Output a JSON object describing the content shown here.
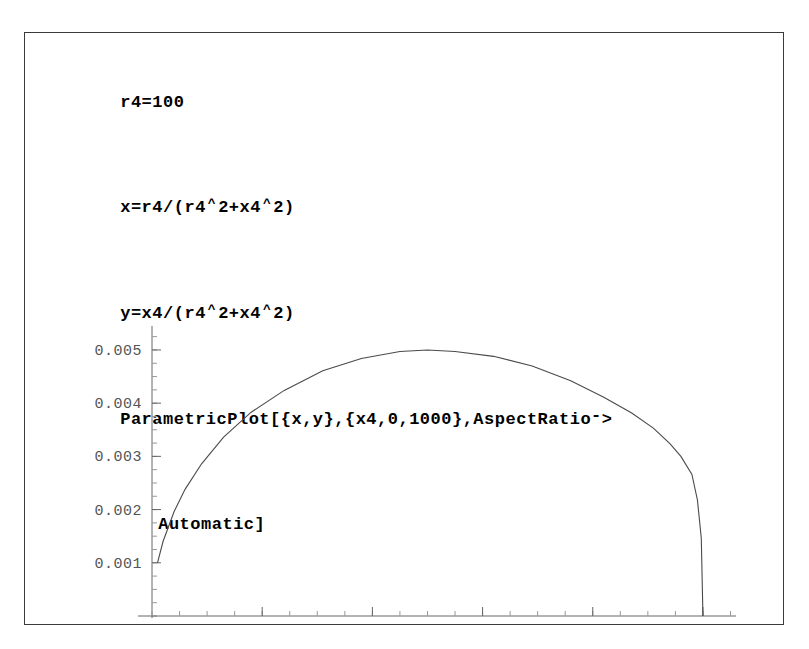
{
  "document": {
    "background_color": "#ffffff",
    "frame_border_color": "#3a3a3a"
  },
  "input_cell": {
    "lines": [
      {
        "id": "line-1",
        "text": "r4=100"
      },
      {
        "id": "line-2",
        "prefix": "x=r4/(r4",
        "caret1": "^",
        "mid": "2+x4",
        "caret2": "^",
        "suffix": "2)"
      },
      {
        "id": "line-3",
        "prefix": "y=x4/(r4",
        "caret1": "^",
        "mid": "2+x4",
        "caret2": "^",
        "suffix": "2)"
      },
      {
        "id": "line-4",
        "prefix": "ParametricPlot[{x,y},{x4,0,1000},AspectRatio",
        "arrow_dash": "-",
        "suffix": ">"
      },
      {
        "id": "line-5",
        "text": "Automatic]"
      }
    ],
    "r4_value": "100",
    "parameter_name": "x4",
    "parameter_min": "0",
    "parameter_max": "1000",
    "aspect_ratio_option": "Automatic"
  },
  "chart_data": {
    "type": "line",
    "title": "",
    "xlabel": "",
    "ylabel": "",
    "xlim": [
      0,
      0.0106
    ],
    "ylim": [
      0,
      0.00545
    ],
    "grid": false,
    "legend": null,
    "x_ticks_major": [
      0.002,
      0.004,
      0.006,
      0.008,
      0.01
    ],
    "x_tick_labels": [
      "0.002",
      "0.004",
      "0.006",
      "0.008",
      "0.01"
    ],
    "y_ticks_major": [
      0.001,
      0.002,
      0.003,
      0.004,
      0.005
    ],
    "y_tick_labels": [
      "0.001",
      "0.002",
      "0.003",
      "0.004",
      "0.005"
    ],
    "x_minor_step": 0.0005,
    "y_minor_step": 0.00025,
    "curve_color": "#4a4a4a",
    "series": [
      {
        "name": "ParametricPlot {x,y}",
        "x": [
          0.0001,
          0.0002,
          0.0004,
          0.0006,
          0.0009,
          0.0013,
          0.0018,
          0.0024,
          0.0031,
          0.0038,
          0.0045,
          0.005,
          0.0055,
          0.0062,
          0.0069,
          0.0076,
          0.0082,
          0.0087,
          0.0091,
          0.0094,
          0.0096,
          0.0098,
          0.0099,
          0.00997,
          0.01
        ],
        "y": [
          0.001,
          0.0014,
          0.00196,
          0.00238,
          0.00286,
          0.00336,
          0.00383,
          0.00424,
          0.00461,
          0.00484,
          0.00497,
          0.005,
          0.00497,
          0.00488,
          0.0047,
          0.00442,
          0.00411,
          0.00382,
          0.00353,
          0.00324,
          0.003,
          0.00266,
          0.00218,
          0.00146,
          0.0
        ]
      }
    ]
  }
}
